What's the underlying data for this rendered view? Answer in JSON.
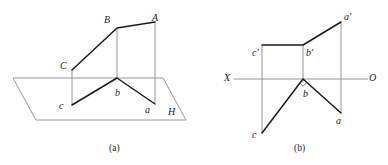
{
  "figure": {
    "background_color": "#ffffff",
    "stroke_dark": "#1a1a1a",
    "stroke_light": "#8a8a8a",
    "label_color": "#1a1a1a"
  },
  "captions": [
    {
      "id": "cap-a",
      "text": "(a)",
      "x": 109,
      "y": 144
    },
    {
      "id": "cap-b",
      "text": "(b)",
      "x": 294,
      "y": 144
    }
  ],
  "panel_a": {
    "name": "spatial-pictorial-view",
    "plane_label": "H",
    "labels": [
      {
        "id": "A",
        "text": "A",
        "x": 152,
        "y": 13
      },
      {
        "id": "B",
        "text": "B",
        "x": 104,
        "y": 15
      },
      {
        "id": "C",
        "text": "C",
        "x": 60,
        "y": 61
      },
      {
        "id": "b",
        "text": "b",
        "x": 115,
        "y": 88
      },
      {
        "id": "c",
        "text": "c",
        "x": 59,
        "y": 101
      },
      {
        "id": "a",
        "text": "a",
        "x": 145,
        "y": 105
      },
      {
        "id": "H",
        "text": "H",
        "x": 168,
        "y": 107
      }
    ],
    "points": {
      "A": [
        155,
        22
      ],
      "B": [
        117,
        28
      ],
      "C": [
        72,
        70
      ],
      "a": [
        155,
        104
      ],
      "b": [
        117,
        78
      ],
      "c": [
        72,
        105
      ]
    },
    "plane_corners": [
      [
        13,
        78
      ],
      [
        163,
        78
      ],
      [
        186,
        120
      ],
      [
        36,
        120
      ]
    ],
    "edges": [
      {
        "from": "A",
        "to": "B",
        "weight": "heavy"
      },
      {
        "from": "B",
        "to": "C",
        "weight": "heavy"
      },
      {
        "from": "a",
        "to": "b",
        "weight": "heavy"
      },
      {
        "from": "b",
        "to": "c",
        "weight": "heavy"
      },
      {
        "from": "A",
        "to": "a",
        "weight": "light"
      },
      {
        "from": "B",
        "to": "b",
        "weight": "light"
      },
      {
        "from": "C",
        "to": "c",
        "weight": "light"
      }
    ]
  },
  "panel_b": {
    "name": "orthographic-projection-view",
    "axis": {
      "x_label": "X",
      "o_label": "O",
      "y": 79,
      "x_start": 234,
      "x_end": 368
    },
    "labels": [
      {
        "id": "a-prime",
        "text": "a'",
        "x": 344,
        "y": 12
      },
      {
        "id": "b-prime",
        "text": "b'",
        "x": 306,
        "y": 48
      },
      {
        "id": "c-prime",
        "text": "c'",
        "x": 252,
        "y": 48
      },
      {
        "id": "b",
        "text": "b",
        "x": 303,
        "y": 89
      },
      {
        "id": "c",
        "text": "c",
        "x": 252,
        "y": 130
      },
      {
        "id": "a",
        "text": "a",
        "x": 336,
        "y": 116
      },
      {
        "id": "X",
        "text": "X",
        "x": 224,
        "y": 73
      },
      {
        "id": "O",
        "text": "O",
        "x": 369,
        "y": 73
      }
    ],
    "points": {
      "a_prime": [
        341,
        22
      ],
      "b_prime": [
        303,
        45
      ],
      "c_prime": [
        262,
        45
      ],
      "a": [
        341,
        113
      ],
      "b": [
        303,
        79
      ],
      "c": [
        262,
        133
      ]
    },
    "right_angle_mark": {
      "at": [
        303,
        79
      ],
      "size": 6
    },
    "edges": [
      {
        "from": "a_prime",
        "to": "b_prime",
        "weight": "heavy"
      },
      {
        "from": "b_prime",
        "to": "c_prime",
        "weight": "heavy"
      },
      {
        "from": "a",
        "to": "b",
        "weight": "heavy"
      },
      {
        "from": "b",
        "to": "c",
        "weight": "heavy"
      },
      {
        "from": "a_prime",
        "to": "a",
        "weight": "light"
      },
      {
        "from": "b_prime",
        "to": "b",
        "weight": "light"
      },
      {
        "from": "c_prime",
        "to": "c",
        "weight": "light"
      }
    ]
  }
}
